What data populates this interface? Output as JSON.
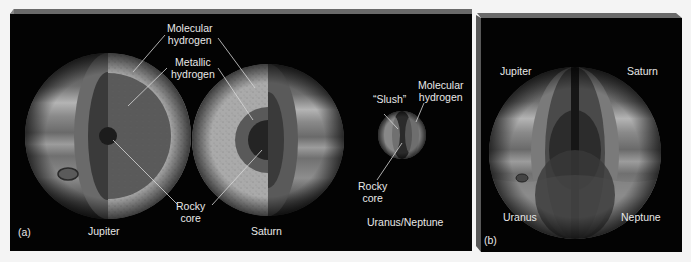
{
  "figure": {
    "panel_a": {
      "tag": "(a)",
      "top_labels": {
        "molecular_hydrogen": [
          "Molecular",
          "hydrogen"
        ],
        "metallic_hydrogen": [
          "Metallic",
          "hydrogen"
        ],
        "rocky_core": [
          "Rocky",
          "core"
        ]
      },
      "uranus_labels": {
        "slush": "“Slush”",
        "molecular_hydrogen": [
          "Molecular",
          "hydrogen"
        ],
        "rocky_core": [
          "Rocky",
          "core"
        ]
      },
      "planets": [
        {
          "name": "Jupiter"
        },
        {
          "name": "Saturn"
        },
        {
          "name": "Uranus/Neptune"
        }
      ]
    },
    "panel_b": {
      "tag": "(b)",
      "quadrant_labels": {
        "top_left": "Jupiter",
        "top_right": "Saturn",
        "bottom_left": "Uranus",
        "bottom_right": "Neptune"
      }
    },
    "colors": {
      "background": "#f4f4f4",
      "panel": "#030303",
      "bevel": "#6a6a6a",
      "molecular_layer": "#a9a9a9",
      "metallic_layer": "#5a5a5a",
      "core": "#1c1c1c",
      "label": "#e8e8e8"
    }
  }
}
